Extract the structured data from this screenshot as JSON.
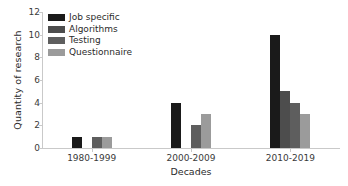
{
  "chart_data": {
    "type": "bar",
    "title": "",
    "xlabel": "Decades",
    "ylabel": "Quantity of research",
    "categories": [
      "1980-1999",
      "2000-2009",
      "2010-2019"
    ],
    "series": [
      {
        "name": "Job specific",
        "color": "#1a1a1a",
        "values": [
          1,
          4,
          10
        ]
      },
      {
        "name": "Algorithms",
        "color": "#4d4d4d",
        "values": [
          0,
          0,
          5
        ]
      },
      {
        "name": "Testing",
        "color": "#5e5e5e",
        "values": [
          1,
          2,
          4
        ]
      },
      {
        "name": "Questionnaire",
        "color": "#9b9b9b",
        "values": [
          1,
          3,
          3
        ]
      }
    ],
    "ylim": [
      0,
      12
    ],
    "yticks": [
      0,
      2,
      4,
      6,
      8,
      10,
      12
    ],
    "ytick_labels": [
      "0",
      "2",
      "4",
      "6",
      "8",
      "10",
      "12"
    ],
    "grid": false,
    "legend_position": "upper left",
    "axis_color": "#c9c9c9",
    "background": "#ffffff"
  }
}
